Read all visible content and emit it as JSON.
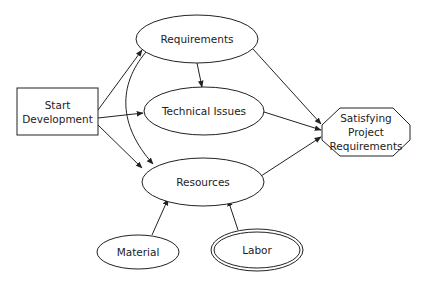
{
  "diagram": {
    "type": "flow-diagram",
    "nodes": {
      "start": {
        "label": "Start\nDevelopment",
        "shape": "rectangle"
      },
      "requirements": {
        "label": "Requirements",
        "shape": "ellipse"
      },
      "technical": {
        "label": "Technical Issues",
        "shape": "ellipse"
      },
      "resources": {
        "label": "Resources",
        "shape": "ellipse"
      },
      "satisfying": {
        "label": "Satisfying\nProject\nRequirements",
        "shape": "octagon"
      },
      "material": {
        "label": "Material",
        "shape": "ellipse"
      },
      "labor": {
        "label": "Labor",
        "shape": "double-ellipse"
      }
    },
    "edges": [
      {
        "from": "Start Development",
        "to": "Requirements"
      },
      {
        "from": "Start Development",
        "to": "Technical Issues"
      },
      {
        "from": "Start Development",
        "to": "Resources"
      },
      {
        "from": "Requirements",
        "to": "Technical Issues"
      },
      {
        "from": "Requirements",
        "to": "Resources"
      },
      {
        "from": "Requirements",
        "to": "Satisfying Project Requirements"
      },
      {
        "from": "Technical Issues",
        "to": "Satisfying Project Requirements"
      },
      {
        "from": "Resources",
        "to": "Satisfying Project Requirements"
      },
      {
        "from": "Material",
        "to": "Resources"
      },
      {
        "from": "Labor",
        "to": "Resources"
      }
    ],
    "colors": {
      "stroke": "#222222",
      "fill": "#ffffff",
      "text": "#222222"
    }
  }
}
